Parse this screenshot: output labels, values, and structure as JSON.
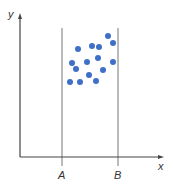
{
  "labels": {
    "y_axis": "y",
    "x_axis": "x",
    "line_a": "A",
    "line_b": "B"
  },
  "colors": {
    "point": "#3f6fc6",
    "axis": "#444444",
    "guide": "#777777"
  },
  "chart_data": {
    "type": "scatter",
    "title": "",
    "xlabel": "x",
    "ylabel": "y",
    "grid": false,
    "vertical_lines": [
      {
        "label": "A",
        "x": 62
      },
      {
        "label": "B",
        "x": 118
      }
    ],
    "points": [
      {
        "x": 108,
        "y": 36
      },
      {
        "x": 113,
        "y": 43
      },
      {
        "x": 78,
        "y": 49
      },
      {
        "x": 92,
        "y": 46
      },
      {
        "x": 99,
        "y": 47
      },
      {
        "x": 98,
        "y": 58
      },
      {
        "x": 72,
        "y": 63
      },
      {
        "x": 87,
        "y": 62
      },
      {
        "x": 113,
        "y": 62
      },
      {
        "x": 76,
        "y": 69
      },
      {
        "x": 103,
        "y": 70
      },
      {
        "x": 89,
        "y": 75
      },
      {
        "x": 70,
        "y": 82
      },
      {
        "x": 80,
        "y": 82
      },
      {
        "x": 96,
        "y": 81
      }
    ]
  }
}
